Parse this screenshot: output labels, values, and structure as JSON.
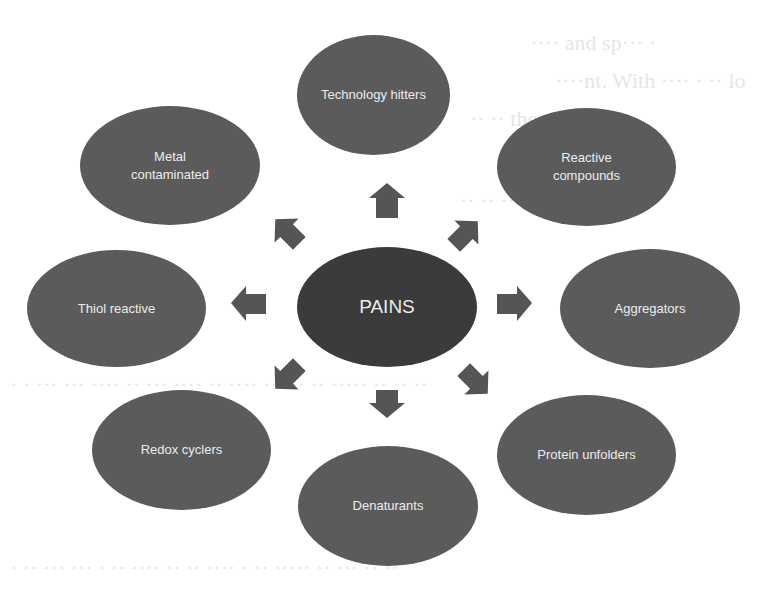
{
  "diagram": {
    "center": {
      "label": "PAINS",
      "color": "#3b3b3b"
    },
    "node_color": "#5b5b5b",
    "arrow_color": "#555555",
    "text_color": "#ececec",
    "nodes": [
      {
        "id": "technology-hitters",
        "label": "Technology hitters",
        "position": "top"
      },
      {
        "id": "reactive-compounds",
        "label": "Reactive compounds",
        "position": "top-right"
      },
      {
        "id": "aggregators",
        "label": "Aggregators",
        "position": "right"
      },
      {
        "id": "protein-unfolders",
        "label": "Protein unfolders",
        "position": "bottom-right"
      },
      {
        "id": "denaturants",
        "label": "Denaturants",
        "position": "bottom"
      },
      {
        "id": "redox-cyclers",
        "label": "Redox cyclers",
        "position": "bottom-left"
      },
      {
        "id": "thiol-reactive",
        "label": "Thiol reactive",
        "position": "left"
      },
      {
        "id": "metal-contaminated",
        "label": "Metal contaminated",
        "position": "top-left"
      }
    ],
    "edges": [
      {
        "from": "PAINS",
        "to": "technology-hitters"
      },
      {
        "from": "PAINS",
        "to": "reactive-compounds"
      },
      {
        "from": "PAINS",
        "to": "aggregators"
      },
      {
        "from": "PAINS",
        "to": "protein-unfolders"
      },
      {
        "from": "PAINS",
        "to": "denaturants"
      },
      {
        "from": "PAINS",
        "to": "redox-cyclers"
      },
      {
        "from": "PAINS",
        "to": "thiol-reactive"
      },
      {
        "from": "PAINS",
        "to": "metal-contaminated"
      }
    ]
  },
  "labels": {
    "center": "PAINS",
    "tech_hitters": "Technology hitters",
    "metal_line1": "Metal",
    "metal_line2": "contaminated",
    "reactive_line1": "Reactive",
    "reactive_line2": "compounds",
    "thiol": "Thiol reactive",
    "aggregators": "Aggregators",
    "redox": "Redox cyclers",
    "protein": "Protein unfolders",
    "denaturants": "Denaturants"
  }
}
